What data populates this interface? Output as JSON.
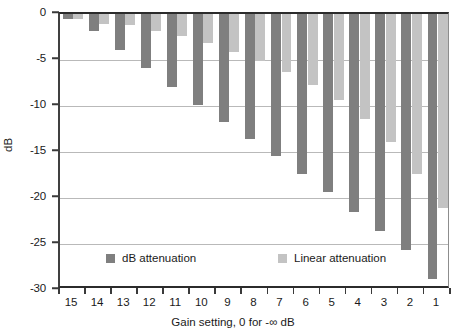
{
  "chart_data": {
    "type": "bar",
    "title": "",
    "xlabel": "Gain setting, 0 for -∞ dB",
    "ylabel": "dB",
    "categories": [
      "15",
      "14",
      "13",
      "12",
      "11",
      "10",
      "9",
      "8",
      "7",
      "6",
      "5",
      "4",
      "3",
      "2",
      "1"
    ],
    "ylim": [
      -30,
      0
    ],
    "y_ticks": [
      0,
      -5,
      -10,
      -15,
      -20,
      -25,
      -30
    ],
    "y_tick_labels": [
      "0",
      "-5",
      "-10",
      "-15",
      "-20",
      "-25",
      "-30"
    ],
    "grid": true,
    "legend_position": "inside-bottom",
    "series": [
      {
        "name": "dB attenuation",
        "color": "#7f7f7f",
        "values": [
          -0.55,
          -1.9,
          -3.9,
          -5.9,
          -7.9,
          -9.9,
          -11.7,
          -13.6,
          -15.4,
          -17.4,
          -19.4,
          -21.5,
          -23.6,
          -25.6,
          -28.8
        ]
      },
      {
        "name": "Linear attenuation",
        "color": "#c3c3c3",
        "values": [
          -0.55,
          -1.1,
          -1.2,
          -1.8,
          -2.4,
          -3.2,
          -4.1,
          -5.1,
          -6.3,
          -7.7,
          -9.4,
          -11.4,
          -13.9,
          -17.4,
          -21.1
        ]
      }
    ]
  },
  "legend": {
    "entries": [
      {
        "label": "dB attenuation",
        "color": "#7f7f7f"
      },
      {
        "label": "Linear attenuation",
        "color": "#c3c3c3"
      }
    ]
  },
  "axes": {
    "y_title": "dB",
    "x_title": "Gain setting, 0 for -∞ dB"
  }
}
